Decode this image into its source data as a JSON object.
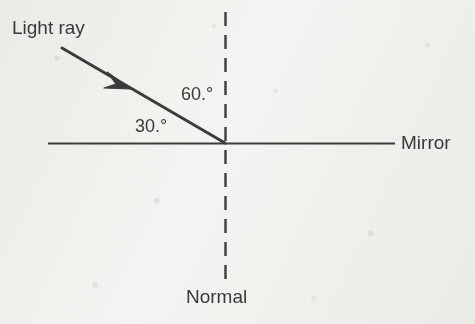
{
  "diagram": {
    "labels": {
      "light_ray": "Light ray",
      "mirror": "Mirror",
      "normal": "Normal",
      "angle_from_normal": "60.°",
      "angle_from_mirror": "30.°"
    },
    "colors": {
      "ink": "#3a3a3a",
      "line": "#3c3c3c",
      "background": "#f6f5f3"
    },
    "geometry": {
      "incidence_point": {
        "x": 225,
        "y": 143
      },
      "ray_start": {
        "x": 62,
        "y": 48
      },
      "ray_arrow_tip": {
        "x": 128,
        "y": 86
      },
      "mirror_line": {
        "x1": 48,
        "y1": 143,
        "x2": 395,
        "y2": 143
      },
      "normal_line": {
        "x1": 225,
        "y1": 12,
        "x2": 225,
        "y2": 286
      },
      "normal_dash": "14 9",
      "angle_from_normal_degrees": 60,
      "angle_from_mirror_degrees": 30
    },
    "icons": {
      "ray_arrowhead": "arrow-head-icon"
    }
  }
}
